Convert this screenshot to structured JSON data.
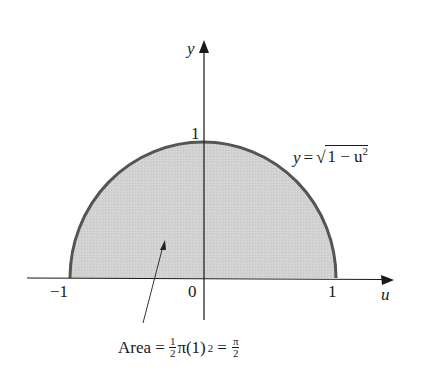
{
  "figure": {
    "type": "semicircle-area-diagram",
    "colors": {
      "fill": "#cfcfcf",
      "curve": "#555555",
      "axes": "#1a1a1a",
      "background": "#ffffff"
    },
    "axes": {
      "x_label": "u",
      "y_label": "y",
      "x_ticks": [
        "−1",
        "0",
        "1"
      ],
      "y_ticks": [
        "1"
      ]
    },
    "curve_label": {
      "lhs": "y",
      "eq": "=",
      "radical": "√",
      "radicand": "1 − u",
      "exponent": "2"
    },
    "area_caption": {
      "prefix": "Area =",
      "frac1_num": "1",
      "frac1_den": "2",
      "middle": "π(1)",
      "exponent": "2",
      "eq": "=",
      "frac2_num": "π",
      "frac2_den": "2"
    }
  }
}
